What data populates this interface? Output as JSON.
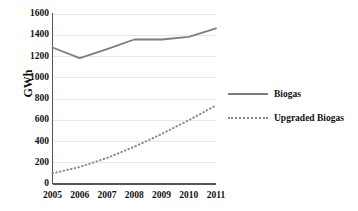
{
  "chart_data": {
    "type": "line",
    "title": "",
    "xlabel": "",
    "ylabel": "GWh",
    "categories": [
      "2005",
      "2006",
      "2007",
      "2008",
      "2009",
      "2010",
      "2011"
    ],
    "x": [
      2005,
      2006,
      2007,
      2008,
      2009,
      2010,
      2011
    ],
    "ylim": [
      0,
      1600
    ],
    "xlim": [
      2005,
      2011
    ],
    "yticks": [
      0,
      200,
      400,
      600,
      800,
      1000,
      1200,
      1400,
      1600
    ],
    "ytick_labels": [
      "0",
      "200",
      "400",
      "600",
      "800",
      "1000",
      "1200",
      "1400",
      "1600"
    ],
    "grid": "horizontal",
    "legend_position": "right",
    "series": [
      {
        "name": "Biogas",
        "style": "solid",
        "color": "#7d7d7d",
        "values": [
          1285,
          1185,
          1270,
          1360,
          1360,
          1385,
          1465
        ]
      },
      {
        "name": "Upgraded Biogas",
        "style": "dotted",
        "color": "#8a8a8a",
        "values": [
          100,
          160,
          245,
          350,
          470,
          600,
          740
        ]
      }
    ]
  },
  "legend": {
    "items": [
      {
        "label": "Biogas",
        "style": "solid"
      },
      {
        "label": "Upgraded Biogas",
        "style": "dotted"
      }
    ]
  },
  "colors": {
    "series_solid": "#7d7d7d",
    "series_dotted": "#8a8a8a",
    "axis": "#555555",
    "grid": "#e8e8e8",
    "text": "#111111",
    "background": "#ffffff"
  }
}
